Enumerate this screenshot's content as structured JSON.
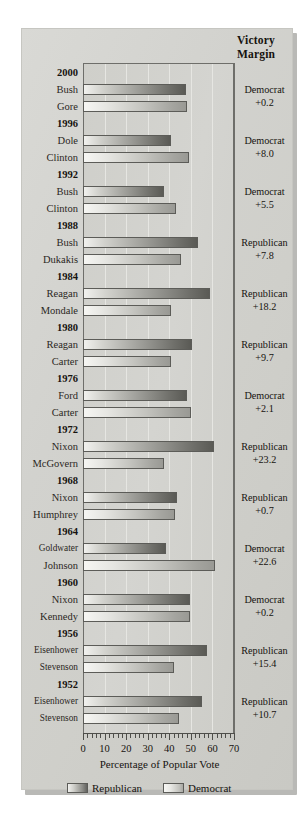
{
  "header": {
    "victory_margin_line1": "Victory",
    "victory_margin_line2": "Margin"
  },
  "axis": {
    "title": "Percentage of Popular Vote",
    "ticks": [
      "0",
      "10",
      "20",
      "30",
      "40",
      "50",
      "60",
      "70"
    ],
    "min": 0,
    "max": 70
  },
  "legend": {
    "republican": "Republican",
    "democrat": "Democrat"
  },
  "chart_data": {
    "type": "bar",
    "title": "",
    "xlabel": "Percentage of Popular Vote",
    "ylabel": "",
    "xlim": [
      0,
      70
    ],
    "grid": true,
    "orientation": "horizontal",
    "legend_position": "bottom",
    "legend_entries": [
      "Republican",
      "Democrat"
    ],
    "annotations_column": "Victory Margin",
    "elections": [
      {
        "year": "2000",
        "republican": {
          "name": "Bush",
          "value": 47.9
        },
        "democrat": {
          "name": "Gore",
          "value": 48.4
        },
        "victory_party": "Democrat",
        "victory_margin": "+0.2"
      },
      {
        "year": "1996",
        "republican": {
          "name": "Dole",
          "value": 40.7
        },
        "democrat": {
          "name": "Clinton",
          "value": 49.2
        },
        "victory_party": "Democrat",
        "victory_margin": "+8.0"
      },
      {
        "year": "1992",
        "republican": {
          "name": "Bush",
          "value": 37.4
        },
        "democrat": {
          "name": "Clinton",
          "value": 43.0
        },
        "victory_party": "Democrat",
        "victory_margin": "+5.5"
      },
      {
        "year": "1988",
        "republican": {
          "name": "Bush",
          "value": 53.4
        },
        "democrat": {
          "name": "Dukakis",
          "value": 45.6
        },
        "victory_party": "Republican",
        "victory_margin": "+7.8"
      },
      {
        "year": "1984",
        "republican": {
          "name": "Reagan",
          "value": 58.8
        },
        "democrat": {
          "name": "Mondale",
          "value": 40.6
        },
        "victory_party": "Republican",
        "victory_margin": "+18.2"
      },
      {
        "year": "1980",
        "republican": {
          "name": "Reagan",
          "value": 50.7
        },
        "democrat": {
          "name": "Carter",
          "value": 41.0
        },
        "victory_party": "Republican",
        "victory_margin": "+9.7"
      },
      {
        "year": "1976",
        "republican": {
          "name": "Ford",
          "value": 48.0
        },
        "democrat": {
          "name": "Carter",
          "value": 50.1
        },
        "victory_party": "Democrat",
        "victory_margin": "+2.1"
      },
      {
        "year": "1972",
        "republican": {
          "name": "Nixon",
          "value": 60.7
        },
        "democrat": {
          "name": "McGovern",
          "value": 37.5
        },
        "victory_party": "Republican",
        "victory_margin": "+23.2"
      },
      {
        "year": "1968",
        "republican": {
          "name": "Nixon",
          "value": 43.4
        },
        "democrat": {
          "name": "Humphrey",
          "value": 42.7
        },
        "victory_party": "Republican",
        "victory_margin": "+0.7"
      },
      {
        "year": "1964",
        "republican": {
          "name": "Goldwater",
          "value": 38.5
        },
        "democrat": {
          "name": "Johnson",
          "value": 61.1
        },
        "victory_party": "Democrat",
        "victory_margin": "+22.6"
      },
      {
        "year": "1960",
        "republican": {
          "name": "Nixon",
          "value": 49.5
        },
        "democrat": {
          "name": "Kennedy",
          "value": 49.7
        },
        "victory_party": "Democrat",
        "victory_margin": "+0.2"
      },
      {
        "year": "1956",
        "republican": {
          "name": "Eisenhower",
          "value": 57.4
        },
        "democrat": {
          "name": "Stevenson",
          "value": 42.0
        },
        "victory_party": "Republican",
        "victory_margin": "+15.4"
      },
      {
        "year": "1952",
        "republican": {
          "name": "Eisenhower",
          "value": 55.1
        },
        "democrat": {
          "name": "Stevenson",
          "value": 44.4
        },
        "victory_party": "Republican",
        "victory_margin": "+10.7"
      }
    ]
  }
}
